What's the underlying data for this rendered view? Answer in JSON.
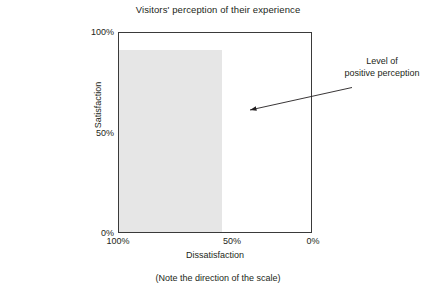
{
  "chart_data": {
    "type": "bar",
    "title": "Visitors' perception of their experience",
    "xlabel": "Dissatisfaction",
    "ylabel": "Satisfaction",
    "footnote": "(Note the direction of the scale)",
    "grid": false,
    "legend": null,
    "x_tick_labels": [
      "100%",
      "50%",
      "0%"
    ],
    "x_tick_values": [
      100,
      50,
      0
    ],
    "xlim": [
      100,
      0
    ],
    "x_axis_reversed": true,
    "y_tick_labels": [
      "100%",
      "50%",
      "0%"
    ],
    "y_tick_values": [
      100,
      50,
      0
    ],
    "ylim": [
      0,
      100
    ],
    "series": [
      {
        "name": "Level of positive perception",
        "satisfaction_percent": 92,
        "dissatisfaction_span_percent": [
          100,
          46
        ],
        "fill_color": "#e6e6e6"
      }
    ],
    "annotations": [
      {
        "text_line_1": "Level of",
        "text_line_2": "positive perception",
        "target_x_percent": 43,
        "target_y_percent": 61
      }
    ]
  },
  "chart": {
    "title": "Visitors' perception of their experience",
    "y_axis": {
      "title": "Satisfaction",
      "ticks": [
        {
          "label": "100%",
          "value": 100
        },
        {
          "label": "50%",
          "value": 50
        },
        {
          "label": "0%",
          "value": 0
        }
      ]
    },
    "x_axis": {
      "title": "Dissatisfaction",
      "ticks": [
        {
          "label": "100%",
          "value": 100
        },
        {
          "label": "50%",
          "value": 50
        },
        {
          "label": "0%",
          "value": 0
        }
      ]
    },
    "footnote": "(Note the direction of the scale)",
    "annotation": {
      "line1": "Level of",
      "line2": "positive perception"
    },
    "band": {
      "fill_color": "#e6e6e6",
      "top_percent": 92,
      "right_percent": 46
    },
    "colors": {
      "frame": "#3a3a3a",
      "text": "#231f20",
      "band": "#e6e6e6",
      "arrow": "#231f20"
    }
  }
}
